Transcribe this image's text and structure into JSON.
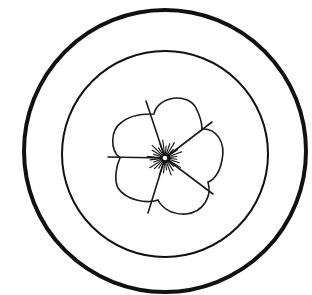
{
  "figure": {
    "title": "Concentric circles with five-petal flower",
    "colors": {
      "stroke": "#111111",
      "background": "#ffffff"
    },
    "outer_circle": {
      "cx": 165,
      "cy": 151,
      "r": 141,
      "stroke_width": 4
    },
    "inner_circle": {
      "cx": 165,
      "cy": 154,
      "r": 103,
      "stroke_width": 2
    },
    "flower": {
      "cx": 165,
      "cy": 158,
      "petal_count": 5,
      "stamen_count": 28
    }
  }
}
